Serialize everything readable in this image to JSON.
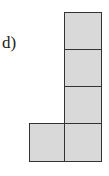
{
  "label": "d)",
  "figure": {
    "fill_color": "#d9d9d9",
    "stroke_color": "#333333",
    "cells": [
      {
        "col": 1,
        "row": 0
      },
      {
        "col": 1,
        "row": 1
      },
      {
        "col": 1,
        "row": 2
      },
      {
        "col": 0,
        "row": 3
      },
      {
        "col": 1,
        "row": 3
      }
    ]
  }
}
